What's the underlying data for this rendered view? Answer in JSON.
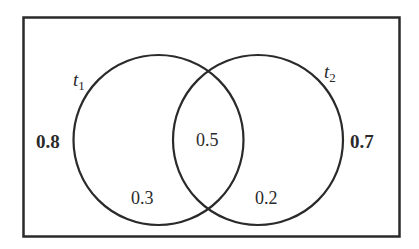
{
  "diagram": {
    "type": "venn",
    "sets": [
      {
        "name": "t1",
        "symbol": "t",
        "subscript": "1",
        "outer_value": "0.8",
        "only_value": "0.3"
      },
      {
        "name": "t2",
        "symbol": "t",
        "subscript": "2",
        "outer_value": "0.7",
        "only_value": "0.2"
      }
    ],
    "intersection_value": "0.5",
    "colors": {
      "stroke": "#2a2a2a",
      "background": "#ffffff"
    }
  }
}
